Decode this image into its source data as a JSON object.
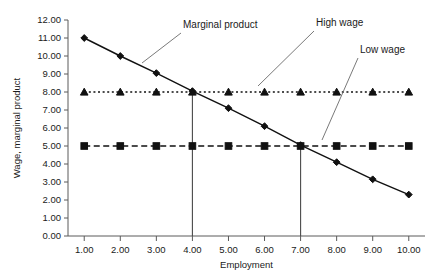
{
  "chart_data": {
    "type": "line",
    "title": "",
    "xlabel": "Employment",
    "ylabel": "Wage, marginal product",
    "x": [
      1,
      2,
      3,
      4,
      5,
      6,
      7,
      8,
      9,
      10
    ],
    "xtick_labels": [
      "1.00",
      "2.00",
      "3.00",
      "4.00",
      "5.00",
      "6.00",
      "7.00",
      "8.00",
      "9.00",
      "10.00"
    ],
    "ytick_labels": [
      "0.00",
      "1.00",
      "2.00",
      "3.00",
      "4.00",
      "5.00",
      "6.00",
      "7.00",
      "8.00",
      "9.00",
      "10.00",
      "11.00",
      "12.00"
    ],
    "ytick_values": [
      0,
      1,
      2,
      3,
      4,
      5,
      6,
      7,
      8,
      9,
      10,
      11,
      12
    ],
    "xlim": [
      0.55,
      10.45
    ],
    "ylim": [
      0,
      12
    ],
    "grid": false,
    "legend_position": "annotations",
    "series": [
      {
        "name": "Marginal product",
        "values": [
          11.0,
          10.0,
          9.05,
          8.05,
          7.1,
          6.1,
          5.05,
          4.1,
          3.15,
          2.3
        ],
        "marker": "diamond",
        "line_style": "solid",
        "color": "#111111"
      },
      {
        "name": "High wage",
        "values": [
          8.0,
          8.0,
          8.0,
          8.0,
          8.0,
          8.0,
          8.0,
          8.0,
          8.0,
          8.0
        ],
        "marker": "triangle",
        "line_style": "dotted",
        "color": "#111111"
      },
      {
        "name": "Low wage",
        "values": [
          5.0,
          5.0,
          5.0,
          5.0,
          5.0,
          5.0,
          5.0,
          5.0,
          5.0,
          5.0
        ],
        "marker": "square",
        "line_style": "dashed",
        "color": "#111111"
      }
    ],
    "annotations": [
      {
        "label": "Marginal product",
        "points_to_x": 3.45,
        "points_to_y": 8.95
      },
      {
        "label": "High wage",
        "points_to_x": 5.05,
        "points_to_y": 8.0
      },
      {
        "label": "Low wage",
        "points_to_x": 7.55,
        "points_to_y": 5.0
      }
    ],
    "reference_lines": [
      {
        "name": "employment-at-high-wage",
        "x": 4,
        "y_from": 0,
        "y_to": 8.0
      },
      {
        "name": "employment-at-low-wage",
        "x": 7,
        "y_from": 0,
        "y_to": 5.0
      }
    ]
  }
}
